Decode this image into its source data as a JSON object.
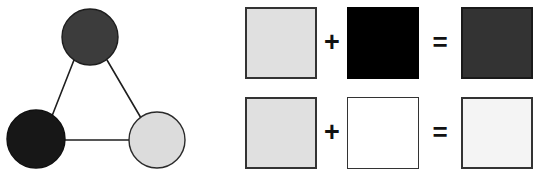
{
  "figure": {
    "background_color": "#ffffff",
    "width": 545,
    "height": 171
  },
  "triad": {
    "caption": "",
    "nodes": [
      {
        "id": "top",
        "label": "dark-gray-node",
        "fill": "#3c3c3c",
        "stroke": "#1d1d1d",
        "cx": 90,
        "cy": 37,
        "r": 28
      },
      {
        "id": "bottom-left",
        "label": "black-node",
        "fill": "#171717",
        "stroke": "#101010",
        "cx": 36,
        "cy": 139,
        "r": 29
      },
      {
        "id": "bottom-right",
        "label": "light-gray-node",
        "fill": "#dcdcdc",
        "stroke": "#2a2a2a",
        "cx": 157,
        "cy": 140,
        "r": 28
      }
    ],
    "edges": [
      {
        "from": "top",
        "to": "bottom-left",
        "stroke": "#1f1f1f"
      },
      {
        "from": "top",
        "to": "bottom-right",
        "stroke": "#1f1f1f"
      },
      {
        "from": "bottom-left",
        "to": "bottom-right",
        "stroke": "#1f1f1f"
      }
    ],
    "edge_width": 1.6
  },
  "equations": {
    "plus_symbol": "+",
    "equals_symbol": "=",
    "rows": [
      {
        "id": "row-1",
        "operand_a": {
          "name": "light-gray-swatch",
          "fill": "#e0e0e0",
          "border": "#333333",
          "border_width": 2
        },
        "operator_1": "+",
        "operand_b": {
          "name": "black-swatch",
          "fill": "#000000",
          "border": "#000000",
          "border_width": 1
        },
        "operator_2": "=",
        "result": {
          "name": "dark-gray-swatch",
          "fill": "#333333",
          "border": "#1a1a1a",
          "border_width": 2
        }
      },
      {
        "id": "row-2",
        "operand_a": {
          "name": "light-gray-swatch",
          "fill": "#e0e0e0",
          "border": "#333333",
          "border_width": 2
        },
        "operator_1": "+",
        "operand_b": {
          "name": "white-swatch",
          "fill": "#ffffff",
          "border": "#333333",
          "border_width": 1
        },
        "operator_2": "=",
        "result": {
          "name": "near-white-swatch",
          "fill": "#f4f4f4",
          "border": "#333333",
          "border_width": 2
        }
      }
    ]
  }
}
